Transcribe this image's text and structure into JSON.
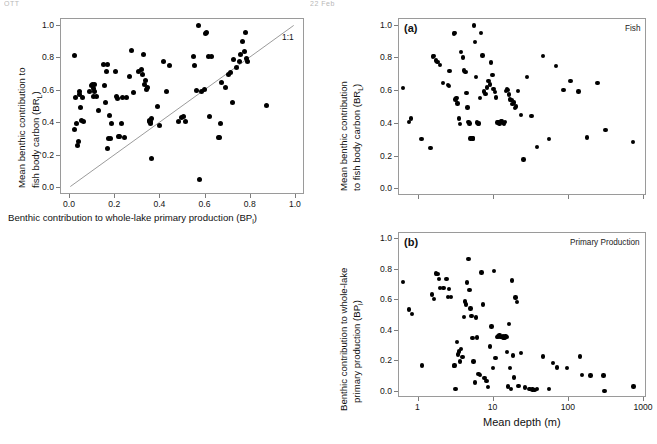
{
  "header": {
    "left": "OTT",
    "right": "22 Feb"
  },
  "figure": {
    "background": "#ffffff",
    "point_color": "#000000",
    "axis_color": "#9a9a9a"
  },
  "chart_data": [
    {
      "id": "left-panel",
      "type": "scatter",
      "title": "",
      "xlabel": "Benthic contribution to whole-lake primary production (BPₗ)",
      "ylabel": "Mean benthic contribution to fish body carbon (BRₗ)",
      "xlabel_plain": "Benthic contribution to whole-lake primary production (BPl)",
      "ylabel_plain": "Mean benthic contribution to fish body carbon (BRl)",
      "xlim": [
        -0.04,
        1.04
      ],
      "ylim": [
        -0.04,
        1.04
      ],
      "xticks": [
        0.0,
        0.2,
        0.4,
        0.6,
        0.8,
        1.0
      ],
      "yticks": [
        0.0,
        0.2,
        0.4,
        0.6,
        0.8,
        1.0
      ],
      "xticklabels": [
        "0.0",
        "0.2",
        "0.4",
        "0.6",
        "0.8",
        "1.0"
      ],
      "yticklabels": [
        "0.0",
        "0.2",
        "0.4",
        "0.6",
        "0.8",
        "1.0"
      ],
      "grid": false,
      "legend": "none",
      "annotations": [
        {
          "text": "1:1",
          "x": 0.95,
          "y": 0.93,
          "name": "one-to-one-label"
        }
      ],
      "reference_line": {
        "name": "1:1 line",
        "from": [
          0.0,
          0.0
        ],
        "to": [
          1.0,
          1.0
        ],
        "color": "#9a9a9a"
      },
      "x": [
        0.018,
        0.022,
        0.02,
        0.028,
        0.035,
        0.038,
        0.04,
        0.042,
        0.048,
        0.05,
        0.055,
        0.06,
        0.085,
        0.095,
        0.1,
        0.103,
        0.105,
        0.108,
        0.11,
        0.118,
        0.125,
        0.15,
        0.152,
        0.155,
        0.16,
        0.165,
        0.168,
        0.17,
        0.175,
        0.178,
        0.185,
        0.2,
        0.205,
        0.21,
        0.215,
        0.22,
        0.228,
        0.232,
        0.24,
        0.248,
        0.265,
        0.272,
        0.282,
        0.305,
        0.318,
        0.322,
        0.325,
        0.33,
        0.335,
        0.338,
        0.345,
        0.35,
        0.352,
        0.355,
        0.358,
        0.36,
        0.362,
        0.385,
        0.398,
        0.412,
        0.428,
        0.44,
        0.48,
        0.492,
        0.5,
        0.512,
        0.545,
        0.552,
        0.56,
        0.568,
        0.572,
        0.58,
        0.595,
        0.6,
        0.605,
        0.612,
        0.618,
        0.628,
        0.655,
        0.66,
        0.665,
        0.672,
        0.688,
        0.7,
        0.71,
        0.718,
        0.722,
        0.735,
        0.748,
        0.755,
        0.762,
        0.77,
        0.775,
        0.78,
        0.785,
        0.868
      ],
      "y": [
        0.818,
        0.558,
        0.362,
        0.398,
        0.262,
        0.288,
        0.578,
        0.598,
        0.497,
        0.418,
        0.56,
        0.408,
        0.598,
        0.632,
        0.64,
        0.612,
        0.566,
        0.598,
        0.64,
        0.562,
        0.478,
        0.762,
        0.632,
        0.53,
        0.718,
        0.76,
        0.248,
        0.308,
        0.448,
        0.306,
        0.4,
        0.72,
        0.562,
        0.552,
        0.316,
        0.318,
        0.398,
        0.556,
        0.312,
        0.56,
        0.688,
        0.845,
        0.588,
        0.718,
        0.73,
        0.7,
        0.82,
        0.64,
        0.66,
        0.608,
        0.618,
        0.408,
        0.418,
        0.412,
        0.398,
        0.428,
        0.182,
        0.502,
        0.388,
        0.78,
        0.598,
        0.752,
        0.412,
        0.438,
        0.442,
        0.408,
        0.812,
        0.755,
        0.602,
        1.0,
        0.055,
        0.598,
        0.608,
        0.952,
        0.96,
        0.812,
        0.442,
        0.812,
        0.312,
        0.315,
        0.396,
        0.652,
        0.622,
        0.7,
        0.712,
        0.528,
        0.79,
        0.745,
        0.782,
        0.82,
        0.905,
        0.838,
        0.958,
        0.795,
        0.782,
        0.512
      ]
    },
    {
      "id": "panel-a",
      "type": "scatter",
      "tag": "(a)",
      "note": "Fish",
      "xlabel": "",
      "ylabel": "Mean benthic contribution to fish body carbon (BRₗ)",
      "ylabel_plain": "Mean benthic contribution to fish body carbon (BRl)",
      "xscale": "log",
      "xlim": [
        0.55,
        1100
      ],
      "ylim": [
        -0.04,
        1.04
      ],
      "yticks": [
        0.0,
        0.2,
        0.4,
        0.6,
        0.8,
        1.0
      ],
      "yticklabels": [
        "0.0",
        "0.2",
        "0.4",
        "0.6",
        "0.8",
        "1.0"
      ],
      "xticks": [
        1,
        10,
        100,
        1000
      ],
      "grid": false,
      "legend": "none",
      "x": [
        0.62,
        0.75,
        0.8,
        1.1,
        1.45,
        1.55,
        1.62,
        1.72,
        1.8,
        1.95,
        2.1,
        2.45,
        2.55,
        2.6,
        2.95,
        3.05,
        3.1,
        3.2,
        3.3,
        3.45,
        3.55,
        3.7,
        3.9,
        4.05,
        4.2,
        4.35,
        4.5,
        4.6,
        4.75,
        4.9,
        5.05,
        5.2,
        5.35,
        5.5,
        5.6,
        5.8,
        6.0,
        6.2,
        6.4,
        6.55,
        6.8,
        7.1,
        7.4,
        7.8,
        8.1,
        8.5,
        8.9,
        9.2,
        9.6,
        10.0,
        10.4,
        10.8,
        11.2,
        11.6,
        12.0,
        12.5,
        12.9,
        13.3,
        13.8,
        14.2,
        14.6,
        15.1,
        15.5,
        16.0,
        16.6,
        17.2,
        17.8,
        18.5,
        19.2,
        20.0,
        21.0,
        23.0,
        25.0,
        28.0,
        32.0,
        38.0,
        45.0,
        55.0,
        68.0,
        85.0,
        105.0,
        135.0,
        175.0,
        240.0,
        310.0,
        720.0
      ],
      "y": [
        0.618,
        0.412,
        0.432,
        0.308,
        0.252,
        0.812,
        0.815,
        0.788,
        0.778,
        0.76,
        0.65,
        0.638,
        0.63,
        0.722,
        0.952,
        0.955,
        0.548,
        0.558,
        0.525,
        0.432,
        0.398,
        0.84,
        0.805,
        0.725,
        0.718,
        0.59,
        0.5,
        0.412,
        0.402,
        0.312,
        0.315,
        0.312,
        0.31,
        1.0,
        0.9,
        0.688,
        0.408,
        0.4,
        0.402,
        0.558,
        0.955,
        0.818,
        0.598,
        0.582,
        0.622,
        0.66,
        0.64,
        0.775,
        0.7,
        0.612,
        0.595,
        0.56,
        0.408,
        0.412,
        0.402,
        0.415,
        0.418,
        0.405,
        0.4,
        0.412,
        0.6,
        0.612,
        0.608,
        0.58,
        0.55,
        0.545,
        0.52,
        0.53,
        0.498,
        0.506,
        0.602,
        0.455,
        0.182,
        0.688,
        0.448,
        0.258,
        0.815,
        0.308,
        0.752,
        0.605,
        0.662,
        0.598,
        0.318,
        0.648,
        0.362,
        0.29
      ]
    },
    {
      "id": "panel-b",
      "type": "scatter",
      "tag": "(b)",
      "note": "Primary Production",
      "xlabel": "Mean depth (m)",
      "ylabel": "Benthic contribution to whole-lake primary production (BPₗ)",
      "ylabel_plain": "Benthic contribution to whole-lake primary production (BPl)",
      "xscale": "log",
      "xlim": [
        0.55,
        1100
      ],
      "ylim": [
        -0.04,
        1.04
      ],
      "yticks": [
        0.0,
        0.2,
        0.4,
        0.6,
        0.8,
        1.0
      ],
      "yticklabels": [
        "0.0",
        "0.2",
        "0.4",
        "0.6",
        "0.8",
        "1.0"
      ],
      "xticks": [
        1,
        10,
        100,
        1000
      ],
      "xticklabels": [
        "1",
        "10",
        "100",
        "1000"
      ],
      "grid": false,
      "legend": "none",
      "x": [
        0.62,
        0.75,
        0.82,
        1.12,
        1.5,
        1.6,
        1.7,
        1.78,
        1.86,
        1.95,
        2.15,
        2.35,
        2.45,
        2.55,
        2.7,
        2.95,
        3.0,
        3.1,
        3.25,
        3.35,
        3.45,
        3.55,
        3.7,
        3.85,
        4.0,
        4.15,
        4.3,
        4.45,
        4.6,
        4.75,
        4.9,
        5.05,
        5.2,
        5.4,
        5.6,
        5.8,
        6.0,
        6.3,
        6.6,
        6.9,
        7.2,
        7.6,
        8.0,
        8.4,
        8.9,
        9.4,
        9.8,
        10.2,
        10.6,
        11.0,
        11.5,
        12.0,
        12.4,
        12.8,
        13.2,
        13.6,
        14.0,
        14.4,
        14.8,
        15.2,
        15.6,
        16.0,
        16.5,
        17.0,
        17.6,
        18.2,
        18.8,
        19.5,
        20.5,
        21.5,
        23.0,
        26.0,
        30.0,
        33.0,
        35.0,
        38.0,
        45.0,
        55.0,
        62.0,
        70.0,
        95.0,
        140.0,
        150.0,
        195.0,
        290.0,
        300.0,
        730.0
      ],
      "y": [
        0.72,
        0.54,
        0.508,
        0.172,
        0.638,
        0.61,
        0.775,
        0.772,
        0.738,
        0.68,
        0.68,
        0.74,
        0.62,
        0.672,
        0.62,
        0.17,
        0.172,
        0.018,
        0.325,
        0.245,
        0.265,
        0.2,
        0.28,
        0.228,
        0.49,
        0.592,
        0.572,
        0.715,
        0.87,
        0.665,
        0.545,
        0.495,
        0.352,
        0.198,
        0.062,
        0.488,
        0.355,
        0.118,
        0.112,
        0.782,
        0.572,
        0.09,
        0.07,
        0.032,
        0.298,
        0.428,
        0.155,
        0.79,
        0.222,
        0.36,
        0.362,
        0.368,
        0.358,
        0.36,
        0.362,
        0.356,
        0.352,
        0.365,
        0.358,
        0.262,
        0.035,
        0.445,
        0.158,
        0.018,
        0.73,
        0.238,
        0.095,
        0.618,
        0.588,
        0.038,
        0.255,
        0.03,
        0.018,
        0.015,
        0.012,
        0.02,
        0.232,
        0.018,
        0.19,
        0.16,
        0.156,
        0.232,
        0.11,
        0.108,
        0.108,
        0.005,
        0.035
      ]
    }
  ]
}
